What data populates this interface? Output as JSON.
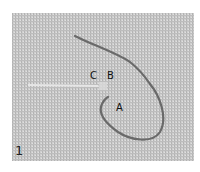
{
  "figure": {
    "step_number": "1",
    "labels": {
      "a": "A",
      "b": "B",
      "c": "C"
    },
    "colors": {
      "fabric": "#c9c9c9",
      "weave_dark": "#a8a8a8",
      "thread": "#6e6e6e",
      "straight_stitch": "#e4e4e4",
      "background": "#ffffff"
    }
  }
}
